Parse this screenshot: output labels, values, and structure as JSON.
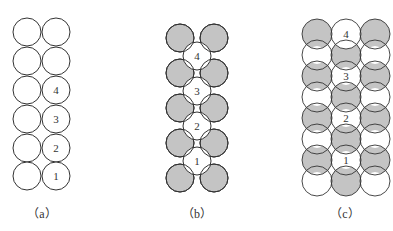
{
  "colors": {
    "stroke": "#333333",
    "gray": "#c4c4c4",
    "white": "#ffffff",
    "label": "#333333"
  },
  "panels": [
    {
      "id": "a",
      "caption": "（a）",
      "caption_x": 42,
      "description": "Two vertical columns of 6 circles in line; right column numbered 4,3,2,1 from top (rows 3-6)",
      "labels": [
        "4",
        "3",
        "2",
        "1"
      ]
    },
    {
      "id": "b",
      "caption": "（b）",
      "caption_x": 197,
      "description": "Two columns of 5 gray circles with 4 white numbered circles nested between them",
      "labels": [
        "4",
        "3",
        "2",
        "1"
      ]
    },
    {
      "id": "c",
      "caption": "（c）",
      "caption_x": 345,
      "description": "Overlapping 3-column circle lattice with alternating gray shading; center column numbered",
      "labels": [
        "4",
        "3",
        "2",
        "1"
      ]
    }
  ]
}
